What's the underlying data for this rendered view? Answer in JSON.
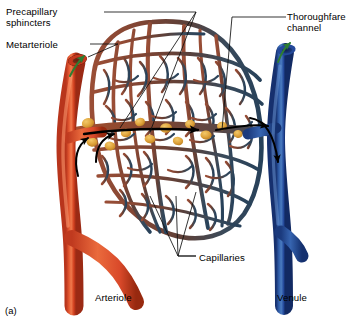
{
  "figure": {
    "panel_label": "(a)"
  },
  "labels": {
    "precapillary_sphincters": "Precapillary\nsphincters",
    "metarteriole": "Metarteriole",
    "thoroughfare_channel": "Thoroughfare\nchannel",
    "capillaries": "Capillaries",
    "arteriole": "Arteriole",
    "venule": "Venule"
  },
  "colors": {
    "background": "#ffffff",
    "text": "#000000",
    "leader_line": "#111111",
    "arteriole_light": "#e8633a",
    "arteriole_mid": "#d8442a",
    "arteriole_dark": "#9e2c18",
    "venule_light": "#3f6ea8",
    "venule_mid": "#2a55a0",
    "venule_dark": "#17306b",
    "capillary_arterial": "#8b4634",
    "capillary_mid": "#5d4036",
    "capillary_venous": "#2c4358",
    "sphincter": "#e0a23c",
    "sphincter_dark": "#c07f1f",
    "flow_arrow": "#000000",
    "cut_end_arrow": "#2e7d32",
    "lumen": "#6b2a16"
  },
  "annotations": {
    "cut_end_markers": [
      "arteriole-cut-end",
      "venule-cut-end"
    ],
    "flow_arrows": [
      "arteriole-inflow",
      "metarteriole-flow",
      "venule-outflow"
    ]
  }
}
